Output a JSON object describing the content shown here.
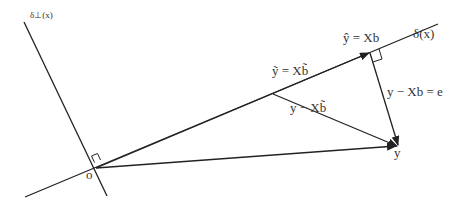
{
  "diagram": {
    "title": "",
    "line_color": "#222222",
    "text_color": "#333333",
    "labels": {
      "subspace": "δ(x)",
      "orthogonal_complement": "δ⊥(x)",
      "projection": "ŷ = Xb",
      "other_fit": "ỹ = Xb̃",
      "other_residual": "y − Xb̃",
      "residual": "y − Xb = e",
      "point_y": "y",
      "origin": "o"
    }
  }
}
